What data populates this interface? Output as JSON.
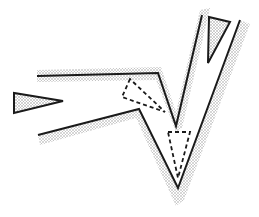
{
  "diagram": {
    "colors": {
      "line": "#1a1a1a",
      "shade": "#c8c8c8",
      "background": "#ffffff"
    },
    "outer_path": [
      [
        37,
        76
      ],
      [
        158,
        73
      ],
      [
        176,
        126
      ],
      [
        202,
        15
      ]
    ],
    "inner_path": [
      [
        38,
        135
      ],
      [
        139,
        109
      ],
      [
        178,
        188
      ],
      [
        240,
        20
      ]
    ],
    "solid_triangle_arm": [
      [
        209,
        17
      ],
      [
        230,
        22
      ],
      [
        208,
        63
      ]
    ],
    "solid_triangle_left": [
      [
        14,
        93
      ],
      [
        14,
        113
      ],
      [
        63,
        101
      ]
    ],
    "dashed_triangle_upper": [
      [
        130,
        79
      ],
      [
        122,
        97
      ],
      [
        165,
        112
      ]
    ],
    "dashed_triangle_lower": [
      [
        168,
        132
      ],
      [
        190,
        132
      ],
      [
        178,
        178
      ]
    ]
  }
}
